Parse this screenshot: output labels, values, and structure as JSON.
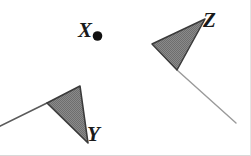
{
  "figure": {
    "background_color": "#ffffff",
    "stroke_color": "#3a3a3a",
    "fill_color": "#808080",
    "label_color": "#1a1a1a",
    "tail_color": "#9a9a9a",
    "labels": {
      "x": "X",
      "y": "Y",
      "z": "Z"
    },
    "marks": [
      {
        "name": "point-x",
        "label": "X",
        "type": "point",
        "center": [
          97.5,
          36
        ],
        "radius": 4.8,
        "fill": "#111111"
      },
      {
        "name": "triangle-y",
        "label": "Y",
        "type": "filled-triangle",
        "points": "80,86 47,103 88,143",
        "fill": "#808080",
        "stroke": "#3a3a3a",
        "tail": {
          "name": "tail-y",
          "from": [
            47,
            103
          ],
          "to": [
            -2,
            127
          ],
          "stroke": "#5a5a5a",
          "width": 1.6
        }
      },
      {
        "name": "triangle-z",
        "label": "Z",
        "type": "filled-triangle",
        "points": "205,19 152,44 177,70",
        "fill": "#808080",
        "stroke": "#3a3a3a",
        "tail": {
          "name": "tail-z",
          "from": [
            177,
            70
          ],
          "to": [
            236,
            123
          ],
          "stroke": "#9a9a9a",
          "width": 1.4
        }
      }
    ]
  }
}
